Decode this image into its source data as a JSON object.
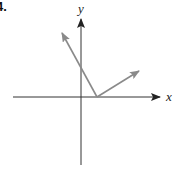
{
  "problem_number": "4.",
  "axes": {
    "x_label": "x",
    "y_label": "y",
    "origin_px": [
      81,
      97
    ],
    "x_range_px": [
      13,
      162
    ],
    "y_range_px": [
      165,
      19
    ]
  },
  "vectors": [
    {
      "name": "vector-left",
      "tail_px": [
        97,
        97
      ],
      "head_px": [
        61,
        32
      ],
      "color": "#8a8a8a"
    },
    {
      "name": "vector-right",
      "tail_px": [
        97,
        97
      ],
      "head_px": [
        139,
        71
      ],
      "color": "#8a8a8a"
    }
  ],
  "colors": {
    "axis": "#222222",
    "vector": "#8a8a8a"
  }
}
